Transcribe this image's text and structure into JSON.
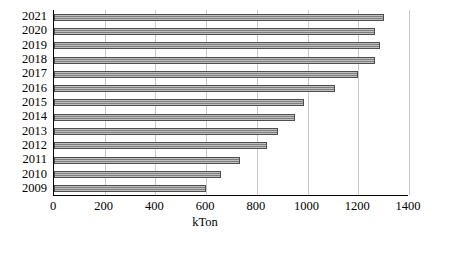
{
  "chart_data": {
    "type": "bar",
    "orientation": "horizontal",
    "title": "",
    "subtitle": "",
    "xlabel": "kTon",
    "ylabel": "",
    "categories": [
      "2021",
      "2020",
      "2019",
      "2018",
      "2017",
      "2016",
      "2015",
      "2014",
      "2013",
      "2012",
      "2011",
      "2010",
      "2009"
    ],
    "values": [
      1300,
      1265,
      1285,
      1265,
      1200,
      1110,
      985,
      950,
      885,
      840,
      735,
      660,
      600
    ],
    "xlim": [
      0,
      1400
    ],
    "xticks": [
      0,
      200,
      400,
      600,
      800,
      1000,
      1200,
      1400
    ],
    "xtick_labels": [
      "0",
      "200",
      "400",
      "600",
      "800",
      "1000",
      "1200",
      "1400"
    ],
    "ytick_labels": [
      "2021",
      "2020",
      "2019",
      "2018",
      "2017",
      "2016",
      "2015",
      "2014",
      "2013",
      "2012",
      "2011",
      "2010",
      "2009"
    ],
    "grid": "vertical",
    "legend": null,
    "legend_position": "none",
    "colors": {
      "bar_fill": "#8c8c8c",
      "bar_border": "#4d4d4d",
      "gridline": "#c8c8c8",
      "axis": "#000000",
      "background": "#ffffff"
    }
  }
}
